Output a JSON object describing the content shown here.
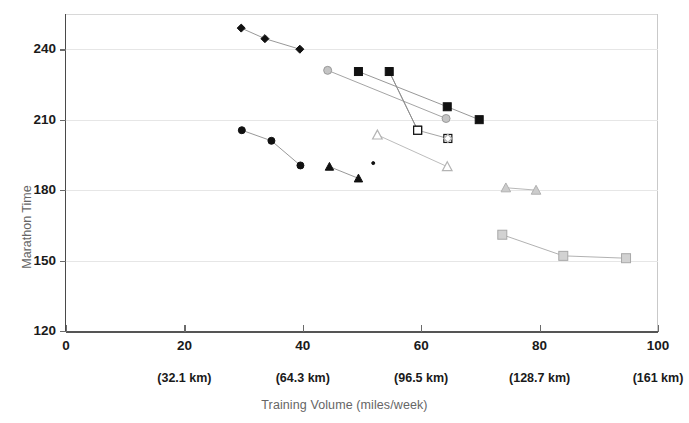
{
  "chart_data": {
    "type": "scatter",
    "title": "",
    "xlabel": "Training Volume (miles/week)",
    "ylabel": "Marathon Time",
    "xlim": [
      0,
      100
    ],
    "ylim": [
      120,
      255
    ],
    "grid": true,
    "legend": "none",
    "x_ticks": [
      {
        "value": 0,
        "label": "0",
        "sublabel": ""
      },
      {
        "value": 20,
        "label": "20",
        "sublabel": "(32.1 km)"
      },
      {
        "value": 40,
        "label": "40",
        "sublabel": "(64.3 km)"
      },
      {
        "value": 60,
        "label": "60",
        "sublabel": "(96.5 km)"
      },
      {
        "value": 80,
        "label": "80",
        "sublabel": "(128.7 km)"
      },
      {
        "value": 100,
        "label": "100",
        "sublabel": "(161 km)"
      }
    ],
    "y_ticks": [
      {
        "value": 240,
        "label": "240"
      },
      {
        "value": 210,
        "label": "210"
      },
      {
        "value": 180,
        "label": "180"
      },
      {
        "value": 150,
        "label": "150"
      },
      {
        "value": 120,
        "label": "120"
      }
    ],
    "series": [
      {
        "name": "black-diamond",
        "marker": "diamond",
        "fill": "#111111",
        "stroke": "#111111",
        "line": "#8c8c8c",
        "size": 7,
        "points": [
          [
            29.6,
            249.0
          ],
          [
            33.6,
            244.5
          ],
          [
            39.5,
            240.0
          ]
        ]
      },
      {
        "name": "black-circle",
        "marker": "circle",
        "fill": "#111111",
        "stroke": "#111111",
        "line": "#8c8c8c",
        "size": 7,
        "points": [
          [
            29.7,
            205.5
          ],
          [
            34.7,
            201.0
          ],
          [
            39.6,
            190.5
          ]
        ]
      },
      {
        "name": "black-triangle",
        "marker": "triangle",
        "fill": "#111111",
        "stroke": "#111111",
        "line": "#8c8c8c",
        "size": 7,
        "points": [
          [
            44.5,
            190.0
          ],
          [
            49.4,
            185.0
          ]
        ]
      },
      {
        "name": "black-dot-small",
        "marker": "circle",
        "fill": "#111111",
        "stroke": "#111111",
        "line": "none",
        "size": 3,
        "points": [
          [
            51.9,
            191.5
          ]
        ]
      },
      {
        "name": "gray-circle",
        "marker": "circle",
        "fill": "#c4c4c4",
        "stroke": "#9a9a9a",
        "line": "#9a9a9a",
        "size": 8,
        "points": [
          [
            44.2,
            231.0
          ],
          [
            64.2,
            210.5
          ]
        ]
      },
      {
        "name": "black-square-a",
        "marker": "square",
        "fill": "#111111",
        "stroke": "#111111",
        "line": "#8c8c8c",
        "size": 8,
        "points": [
          [
            49.4,
            230.5
          ],
          [
            64.4,
            215.5
          ],
          [
            69.8,
            210.0
          ]
        ]
      },
      {
        "name": "black-square-b",
        "marker": "square",
        "fill": "#111111",
        "stroke": "#111111",
        "line": "#8c8c8c",
        "size": 8,
        "points": [
          [
            54.6,
            230.5
          ],
          [
            59.4,
            205.5
          ]
        ]
      },
      {
        "name": "open-square",
        "marker": "square-open",
        "fill": "#ffffff",
        "stroke": "#111111",
        "line": "#9a9a9a",
        "size": 8,
        "points": [
          [
            59.4,
            205.5
          ],
          [
            64.5,
            202.0
          ]
        ]
      },
      {
        "name": "open-diamond",
        "marker": "diamond-open",
        "fill": "#ffffff",
        "stroke": "#b0b0b0",
        "line": "#b0b0b0",
        "size": 7,
        "points": [
          [
            64.5,
            202.0
          ]
        ]
      },
      {
        "name": "open-triangle",
        "marker": "triangle-open",
        "fill": "#ffffff",
        "stroke": "#b4b4b4",
        "line": "#b4b4b4",
        "size": 8,
        "points": [
          [
            52.6,
            203.5
          ],
          [
            64.4,
            190.0
          ]
        ]
      },
      {
        "name": "gray-triangle",
        "marker": "triangle",
        "fill": "#cccccc",
        "stroke": "#b0b0b0",
        "line": "#b0b0b0",
        "size": 8,
        "points": [
          [
            74.3,
            181.0
          ],
          [
            79.4,
            180.0
          ]
        ]
      },
      {
        "name": "gray-square",
        "marker": "square",
        "fill": "#d2d2d2",
        "stroke": "#a8a8a8",
        "line": "#a8a8a8",
        "size": 9,
        "points": [
          [
            73.7,
            161.0
          ],
          [
            84.0,
            152.0
          ],
          [
            94.6,
            151.0
          ]
        ]
      }
    ]
  }
}
